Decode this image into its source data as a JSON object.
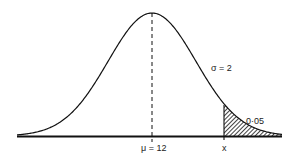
{
  "diagram": {
    "type": "normal-distribution",
    "labels": {
      "sigma": "σ = 2",
      "tail_area": "0·05",
      "mean": "μ = 12",
      "x_marker": "x"
    },
    "parameters": {
      "mean": 12,
      "std_dev": 2,
      "upper_tail_probability": 0.05
    },
    "colors": {
      "curve": "#111111",
      "axis": "#111111",
      "hatch": "#111111",
      "background": "#ffffff"
    }
  }
}
